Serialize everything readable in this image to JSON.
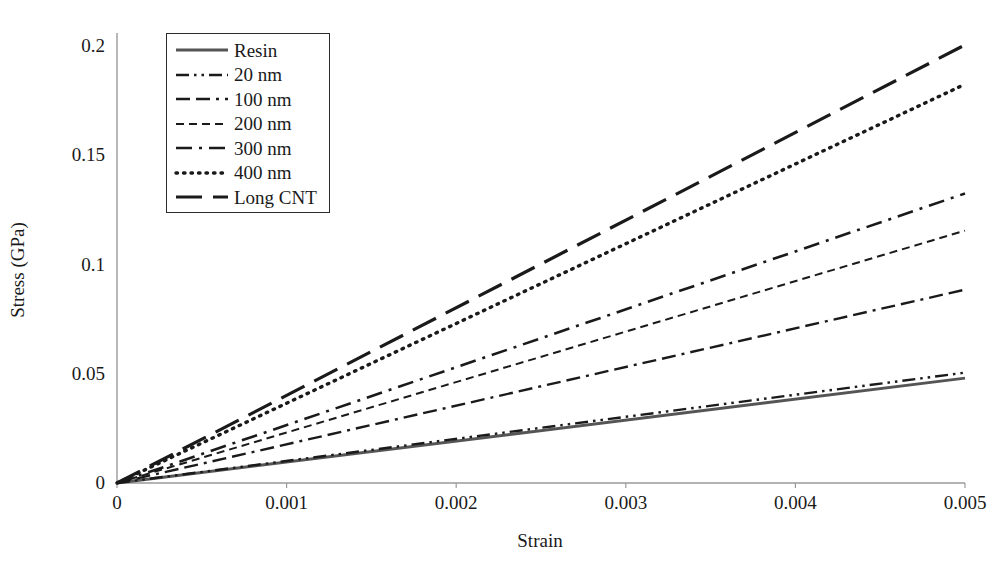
{
  "chart_data": {
    "type": "line",
    "title": "",
    "xlabel": "Strain",
    "ylabel": "Stress (GPa)",
    "xlim": [
      0,
      0.005
    ],
    "ylim": [
      0,
      0.21
    ],
    "xticks": [
      "0",
      "0.001",
      "0.002",
      "0.003",
      "0.004",
      "0.005"
    ],
    "xtick_values": [
      0,
      0.001,
      0.002,
      0.003,
      0.004,
      0.005
    ],
    "yticks": [
      "0",
      "0.05",
      "0.1",
      "0.15",
      "0.2"
    ],
    "ytick_values": [
      0,
      0.05,
      0.1,
      0.15,
      0.2
    ],
    "grid": false,
    "legend_position": "upper left",
    "x": [
      0,
      0.005
    ],
    "series": [
      {
        "name": "Resin",
        "values": [
          0,
          0.048
        ],
        "modulus_gpa": 9.6,
        "style": "solid",
        "color": "#555555"
      },
      {
        "name": "20 nm",
        "values": [
          0,
          0.0505
        ],
        "modulus_gpa": 10.1,
        "style": "dash-dot-dot",
        "color": "#1a1a1a"
      },
      {
        "name": "100 nm",
        "values": [
          0,
          0.0885
        ],
        "modulus_gpa": 17.7,
        "style": "dash-dot",
        "color": "#1a1a1a"
      },
      {
        "name": "200 nm",
        "values": [
          0,
          0.1155
        ],
        "modulus_gpa": 23.1,
        "style": "fine-dash",
        "color": "#1a1a1a"
      },
      {
        "name": "300 nm",
        "values": [
          0,
          0.1325
        ],
        "modulus_gpa": 26.5,
        "style": "long-dash-dot",
        "color": "#1a1a1a"
      },
      {
        "name": "400 nm",
        "values": [
          0,
          0.1825
        ],
        "modulus_gpa": 36.5,
        "style": "dotted",
        "color": "#1a1a1a"
      },
      {
        "name": "Long CNT",
        "values": [
          0,
          0.2005
        ],
        "modulus_gpa": 40.1,
        "style": "long-dash",
        "color": "#1a1a1a"
      }
    ]
  },
  "axes": {
    "xlabel": "Strain",
    "ylabel": "Stress (GPa)"
  },
  "legend": {
    "items": [
      {
        "label": "Resin"
      },
      {
        "label": "20 nm"
      },
      {
        "label": "100 nm"
      },
      {
        "label": "200 nm"
      },
      {
        "label": "300 nm"
      },
      {
        "label": "400 nm"
      },
      {
        "label": "Long CNT"
      }
    ]
  }
}
